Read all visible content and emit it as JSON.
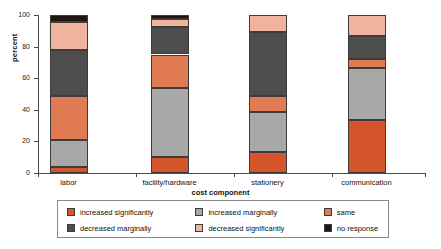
{
  "chart_data": {
    "type": "bar",
    "subtype": "stacked-percentage",
    "title": "",
    "xlabel": "cost component",
    "ylabel": "percent",
    "ylim": [
      0,
      100
    ],
    "yticks": [
      0,
      20,
      40,
      60,
      80,
      100
    ],
    "ytick_labels": [
      "0",
      "20",
      "40",
      "60",
      "80",
      "100"
    ],
    "grid": false,
    "legend_position": "bottom",
    "categories": [
      "labor",
      "facility/hardware",
      "stationery",
      "communication"
    ],
    "series": [
      {
        "name": "increased significantly",
        "color": "#D4552B",
        "values": [
          3.5,
          10.0,
          13.5,
          33.5
        ]
      },
      {
        "name": "increased marginally",
        "color": "#A8A8A8",
        "values": [
          17.5,
          44.0,
          25.0,
          33.0
        ]
      },
      {
        "name": "same",
        "color": "#E07A52",
        "values": [
          28.0,
          21.0,
          10.5,
          5.5
        ]
      },
      {
        "name": "decreased marginally",
        "color": "#4D4D4D",
        "values": [
          29.0,
          17.5,
          40.0,
          15.0
        ]
      },
      {
        "name": "decreased significantly",
        "color": "#F0B49C",
        "values": [
          17.5,
          5.0,
          11.0,
          13.0
        ]
      },
      {
        "name": "no response",
        "color": "#241410",
        "values": [
          4.5,
          2.5,
          0.0,
          0.0
        ]
      }
    ],
    "cumulative_tops": {
      "labor": [
        3.5,
        21.0,
        49.0,
        78.0,
        95.5,
        100.0
      ],
      "facility/hardware": [
        10.0,
        54.0,
        75.0,
        92.5,
        97.5,
        100.0
      ],
      "stationery": [
        13.5,
        38.5,
        49.0,
        89.0,
        100.0,
        100.0
      ],
      "communication": [
        33.5,
        66.5,
        72.0,
        87.0,
        100.0,
        100.0
      ]
    }
  },
  "legend": {
    "items": [
      {
        "label": "increased significantly",
        "color": "#D4552B"
      },
      {
        "label": "increased marginally",
        "color": "#A8A8A8"
      },
      {
        "label": "same",
        "color": "#E07A52"
      },
      {
        "label": "decreased marginally",
        "color": "#4D4D4D"
      },
      {
        "label": "decreased significantly",
        "color": "#F0B49C"
      },
      {
        "label": "no response",
        "color": "#241410"
      }
    ]
  },
  "axes": {
    "y_title": "percent",
    "x_title": "cost component"
  }
}
